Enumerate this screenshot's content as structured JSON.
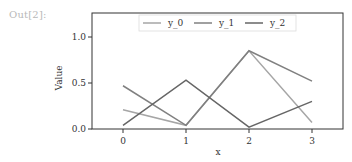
{
  "cell": {
    "prompt": "Out[2]:"
  },
  "colors": {
    "y_0": "#a6a6a6",
    "y_1": "#808080",
    "y_2": "#666666",
    "axis": "#333333"
  },
  "chart_data": {
    "type": "line",
    "title": "",
    "xlabel": "x",
    "ylabel": "Value",
    "x": [
      0,
      1,
      2,
      3
    ],
    "xticks": [
      "0",
      "1",
      "2",
      "3"
    ],
    "yticks": [
      "0.0",
      "0.5",
      "1.0"
    ],
    "ylim": [
      0.0,
      1.25
    ],
    "xlim": [
      -0.5,
      3.5
    ],
    "grid": false,
    "legend_position": "upper center",
    "series": [
      {
        "name": "y_0",
        "values": [
          0.21,
          0.04,
          0.85,
          0.07
        ]
      },
      {
        "name": "y_1",
        "values": [
          0.47,
          0.04,
          0.85,
          0.52
        ]
      },
      {
        "name": "y_2",
        "values": [
          0.04,
          0.53,
          0.02,
          0.3
        ]
      }
    ]
  }
}
